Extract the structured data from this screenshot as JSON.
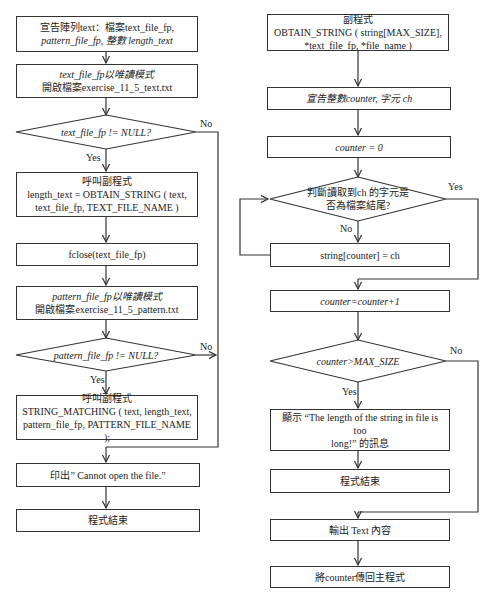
{
  "main_flow": {
    "declare": {
      "line1": "宣告陣列text：檔案text_file_fp,",
      "line2": "pattern_file_fp, 整數 length_text"
    },
    "open_text": {
      "line1": "text_file_fp以唯讀模式",
      "line2": "開啟檔案exercise_11_5_text.txt"
    },
    "check_text": "text_file_fp != NULL?",
    "call_obtain": {
      "line1": "呼叫副程式",
      "line2": "length_text = OBTAIN_STRING ( text,",
      "line3": "text_file_fp, TEXT_FILE_NAME )"
    },
    "fclose": "fclose(text_file_fp)",
    "open_pattern": {
      "line1": "pattern_file_fp以唯讀模式",
      "line2": "開啟檔案exercise_11_5_pattern.txt"
    },
    "check_pattern": "pattern_file_fp != NULL?",
    "call_matching": {
      "line1": "呼叫副程式",
      "line2": "STRING_MATCHING ( text, length_text,",
      "line3": "pattern_file_fp, PATTERN_FILE_NAME );"
    },
    "print_error": "印出” Cannot open the file.”",
    "end": "程式結束"
  },
  "sub_flow": {
    "header": {
      "line1": "副程式",
      "line2": "OBTAIN_STRING ( string[MAX_SIZE],",
      "line3": "*text_file_fp, *file_name )"
    },
    "declare": "宣告整數counter, 字元 ch",
    "init": "counter = 0",
    "check_eof": {
      "line1": "判斷讀取到ch 的字元是",
      "line2": "否為檔案結尾?"
    },
    "assign": "string[counter] = ch",
    "increment": "counter=counter+1",
    "check_size": "counter>MAX_SIZE",
    "show_msg": {
      "line1": "顯示 “The length of the string in file is too",
      "line2": "long!” 的訊息"
    },
    "end": "程式結束",
    "output": "輸出 Text 內容",
    "return": "將counter傳回主程式"
  },
  "labels": {
    "yes": "Yes",
    "no": "No"
  }
}
